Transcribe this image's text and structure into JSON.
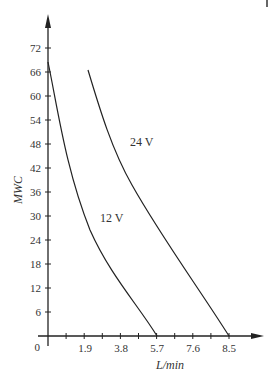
{
  "chart_data": {
    "type": "line",
    "title": "",
    "xlabel": "L/min",
    "ylabel": "MWC",
    "x_tick_labels": [
      "0",
      "1.9",
      "3.8",
      "5.7",
      "7.6",
      "8.5"
    ],
    "y_tick_labels": [
      "6",
      "12",
      "18",
      "24",
      "30",
      "36",
      "42",
      "48",
      "54",
      "60",
      "66",
      "72"
    ],
    "origin_label": "0",
    "ylim": [
      0,
      72
    ],
    "xlim": [
      0,
      8.5
    ],
    "grid": false,
    "legend": "inline curve labels",
    "series": [
      {
        "name": "12 V",
        "label": "12 V",
        "points": [
          [
            0,
            68.5
          ],
          [
            0.6,
            52
          ],
          [
            1.4,
            38
          ],
          [
            2.4,
            24
          ],
          [
            3.6,
            12
          ],
          [
            5.7,
            0
          ]
        ]
      },
      {
        "name": "24 V",
        "label": "24 V",
        "points": [
          [
            2.0,
            66.5
          ],
          [
            3.2,
            48
          ],
          [
            4.2,
            38
          ],
          [
            5.4,
            26
          ],
          [
            6.7,
            13
          ],
          [
            8.5,
            0
          ]
        ]
      }
    ]
  }
}
